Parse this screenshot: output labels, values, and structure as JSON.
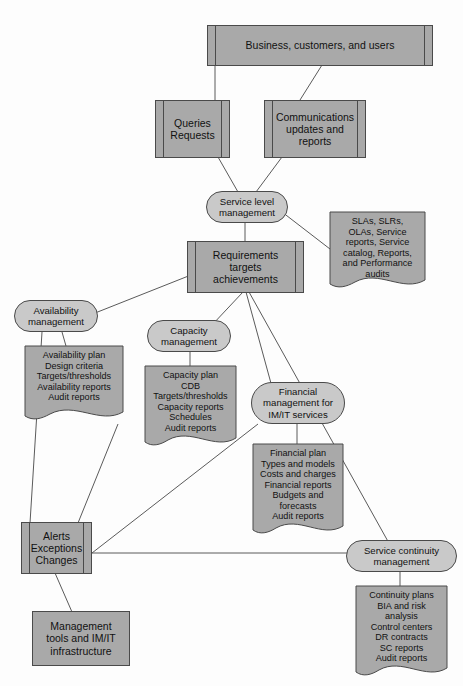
{
  "diagram": {
    "colors": {
      "node_fill": "#a9a9a9",
      "capsule_fill": "#c9c9c9",
      "stroke": "#4a4a4a",
      "background": "#fdfdfd",
      "text": "#111111"
    },
    "nodes": [
      {
        "id": "business",
        "shape": "process",
        "label": "Business, customers, and users"
      },
      {
        "id": "queries",
        "shape": "process",
        "label": "Queries\nRequests"
      },
      {
        "id": "communications",
        "shape": "process",
        "label": "Communications\nupdates and\nreports"
      },
      {
        "id": "service-level-mgmt",
        "shape": "capsule",
        "label": "Service level\nmanagement"
      },
      {
        "id": "slm-outputs",
        "shape": "document",
        "label": "SLAs, SLRs,\nOLAs, Service\nreports, Service\ncatalog, Reports,\nand Performance\naudits"
      },
      {
        "id": "requirements",
        "shape": "process",
        "label": "Requirements\ntargets\nachievements"
      },
      {
        "id": "availability-mgmt",
        "shape": "capsule",
        "label": "Availability\nmanagement"
      },
      {
        "id": "availability-outputs",
        "shape": "document",
        "label": "Availability plan\nDesign criteria\nTargets/thresholds\nAvailability reports\nAudit reports"
      },
      {
        "id": "capacity-mgmt",
        "shape": "capsule",
        "label": "Capacity\nmanagement"
      },
      {
        "id": "capacity-outputs",
        "shape": "document",
        "label": "Capacity plan\nCDB\nTargets/thresholds\nCapacity reports\nSchedules\nAudit reports"
      },
      {
        "id": "financial-mgmt",
        "shape": "capsule",
        "label": "Financial\nmanagement for\nIM/IT services"
      },
      {
        "id": "financial-outputs",
        "shape": "document",
        "label": "Financial plan\nTypes and models\nCosts and charges\nFinancial reports\nBudgets and\nforecasts\nAudit reports"
      },
      {
        "id": "alerts",
        "shape": "process",
        "label": "Alerts\nExceptions\nChanges"
      },
      {
        "id": "service-continuity",
        "shape": "capsule",
        "label": "Service continuity\nmanagement"
      },
      {
        "id": "continuity-outputs",
        "shape": "document",
        "label": "Continuity plans\nBIA and risk\nanalysis\nControl centers\nDR contracts\nSC reports\nAudit reports"
      },
      {
        "id": "mgmt-tools",
        "shape": "plain",
        "label": "Management\ntools and IM/IT\ninfrastructure"
      }
    ],
    "edges": [
      {
        "from": "business",
        "to": "queries"
      },
      {
        "from": "business",
        "to": "communications"
      },
      {
        "from": "queries",
        "to": "service-level-mgmt"
      },
      {
        "from": "communications",
        "to": "service-level-mgmt"
      },
      {
        "from": "service-level-mgmt",
        "to": "requirements"
      },
      {
        "from": "service-level-mgmt",
        "to": "slm-outputs"
      },
      {
        "from": "requirements",
        "to": "availability-mgmt"
      },
      {
        "from": "requirements",
        "to": "capacity-mgmt"
      },
      {
        "from": "requirements",
        "to": "financial-mgmt"
      },
      {
        "from": "requirements",
        "to": "service-continuity"
      },
      {
        "from": "availability-mgmt",
        "to": "availability-outputs"
      },
      {
        "from": "capacity-mgmt",
        "to": "capacity-outputs"
      },
      {
        "from": "financial-mgmt",
        "to": "financial-outputs"
      },
      {
        "from": "service-continuity",
        "to": "continuity-outputs"
      },
      {
        "from": "availability-mgmt",
        "to": "alerts"
      },
      {
        "from": "capacity-mgmt",
        "to": "alerts"
      },
      {
        "from": "financial-mgmt",
        "to": "alerts"
      },
      {
        "from": "service-continuity",
        "to": "alerts"
      },
      {
        "from": "alerts",
        "to": "mgmt-tools"
      }
    ]
  }
}
